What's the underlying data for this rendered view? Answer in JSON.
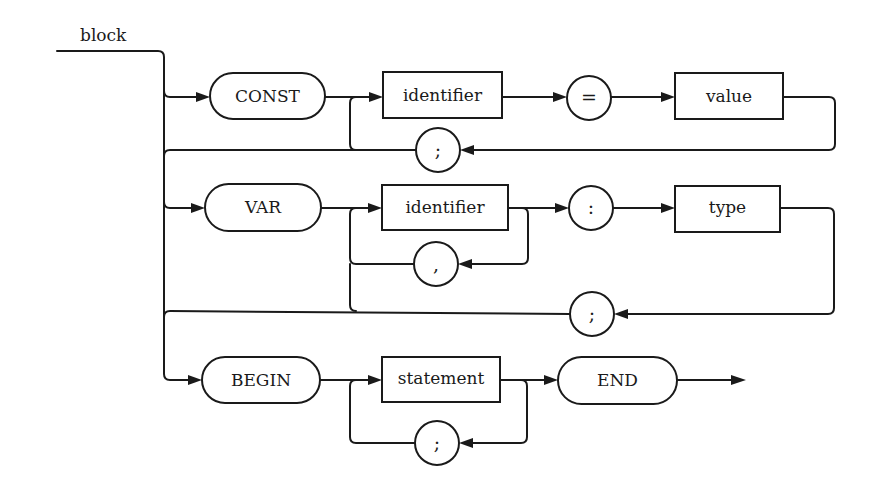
{
  "diagram": {
    "title": "block",
    "type": "syntax-railroad-diagram",
    "colors": {
      "ink": "#1a1a1a",
      "background": "#ffffff"
    },
    "rows": [
      {
        "name": "const-section",
        "nodes": [
          {
            "kind": "terminal",
            "shape": "pill",
            "label": "CONST"
          },
          {
            "kind": "nonterminal",
            "shape": "box",
            "label": "identifier"
          },
          {
            "kind": "terminal",
            "shape": "circle",
            "label": "="
          },
          {
            "kind": "nonterminal",
            "shape": "box",
            "label": "value"
          },
          {
            "kind": "terminal",
            "shape": "circle",
            "label": ";",
            "role": "repeat-separator"
          }
        ]
      },
      {
        "name": "var-section",
        "nodes": [
          {
            "kind": "terminal",
            "shape": "pill",
            "label": "VAR"
          },
          {
            "kind": "nonterminal",
            "shape": "box",
            "label": "identifier"
          },
          {
            "kind": "terminal",
            "shape": "circle",
            "label": ",",
            "role": "list-separator"
          },
          {
            "kind": "terminal",
            "shape": "circle",
            "label": ":"
          },
          {
            "kind": "nonterminal",
            "shape": "box",
            "label": "type"
          },
          {
            "kind": "terminal",
            "shape": "circle",
            "label": ";",
            "role": "repeat-separator"
          }
        ]
      },
      {
        "name": "begin-section",
        "nodes": [
          {
            "kind": "terminal",
            "shape": "pill",
            "label": "BEGIN"
          },
          {
            "kind": "nonterminal",
            "shape": "box",
            "label": "statement"
          },
          {
            "kind": "terminal",
            "shape": "circle",
            "label": ";",
            "role": "list-separator"
          },
          {
            "kind": "terminal",
            "shape": "pill",
            "label": "END"
          }
        ]
      }
    ]
  }
}
